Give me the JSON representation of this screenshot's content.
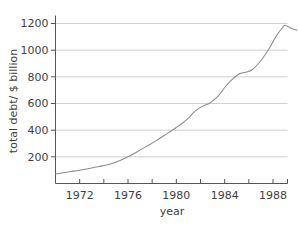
{
  "chart_data": {
    "type": "line",
    "title": "",
    "xlabel": "year",
    "ylabel": "total debt/ $ billion",
    "xlim": [
      1970,
      1989.2
    ],
    "ylim": [
      0,
      1260
    ],
    "grid": true,
    "legend": false,
    "legend_position": "none",
    "line_color": "#8c8c8c",
    "axis_color": "#555555",
    "grid_color": "#c9c9c9",
    "background_color": "#ffffff",
    "x_ticks_major": [
      1972,
      1976,
      1980,
      1984,
      1988
    ],
    "x_tick_labels": [
      "1972",
      "1976",
      "1980",
      "1984",
      "1988"
    ],
    "x_ticks_all": [
      1970,
      1972,
      1974,
      1976,
      1978,
      1980,
      1982,
      1984,
      1986,
      1988
    ],
    "y_ticks": [
      200,
      400,
      600,
      800,
      1000,
      1200
    ],
    "y_tick_labels": [
      "200",
      "400",
      "600",
      "800",
      "1000",
      "1200"
    ],
    "series": [
      {
        "name": "total debt",
        "x": [
          1970,
          1971,
          1972,
          1973,
          1974,
          1975,
          1976,
          1977,
          1978,
          1979,
          1980,
          1981,
          1982,
          1983,
          1984,
          1985,
          1986,
          1987,
          1988
        ],
        "values": [
          70,
          83,
          97,
          113,
          133,
          163,
          205,
          258,
          318,
          385,
          455,
          540,
          585,
          610,
          700,
          800,
          832,
          845,
          930
        ]
      }
    ],
    "points": [
      [
        1970.0,
        72
      ],
      [
        1970.6,
        80
      ],
      [
        1971.3,
        90
      ],
      [
        1972.0,
        100
      ],
      [
        1972.8,
        113
      ],
      [
        1973.6,
        127
      ],
      [
        1974.4,
        143
      ],
      [
        1975.2,
        167
      ],
      [
        1976.0,
        200
      ],
      [
        1976.8,
        240
      ],
      [
        1977.6,
        282
      ],
      [
        1978.4,
        325
      ],
      [
        1979.2,
        372
      ],
      [
        1980.0,
        420
      ],
      [
        1980.5,
        452
      ],
      [
        1981.0,
        490
      ],
      [
        1981.4,
        530
      ],
      [
        1981.8,
        560
      ],
      [
        1982.2,
        580
      ],
      [
        1982.7,
        600
      ],
      [
        1983.1,
        625
      ],
      [
        1983.6,
        670
      ],
      [
        1984.0,
        720
      ],
      [
        1984.5,
        770
      ],
      [
        1985.0,
        810
      ],
      [
        1985.4,
        828
      ],
      [
        1985.9,
        838
      ],
      [
        1986.3,
        855
      ],
      [
        1986.8,
        900
      ],
      [
        1987.3,
        960
      ],
      [
        1987.8,
        1030
      ],
      [
        1988.3,
        1110
      ],
      [
        1988.8,
        1170
      ],
      [
        1989.0,
        1187
      ],
      [
        1989.6,
        1160
      ],
      [
        1990.0,
        1150
      ]
    ]
  }
}
